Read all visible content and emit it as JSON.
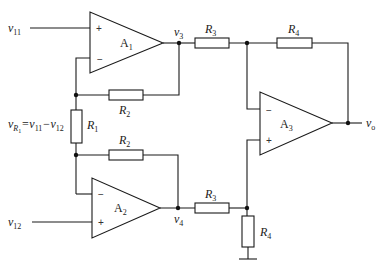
{
  "diagram": {
    "type": "instrumentation-amplifier-circuit",
    "amplifiers": [
      {
        "id": "A1",
        "label": "A",
        "sub": "1",
        "plus": "+",
        "minus": "−"
      },
      {
        "id": "A2",
        "label": "A",
        "sub": "2",
        "plus": "+",
        "minus": "−"
      },
      {
        "id": "A3",
        "label": "A",
        "sub": "3",
        "plus": "+",
        "minus": "−"
      }
    ],
    "resistors": {
      "R1": {
        "label": "R",
        "sub": "1"
      },
      "R2_top": {
        "label": "R",
        "sub": "2"
      },
      "R2_bottom": {
        "label": "R",
        "sub": "2"
      },
      "R3_top": {
        "label": "R",
        "sub": "3"
      },
      "R3_bottom": {
        "label": "R",
        "sub": "3"
      },
      "R4_top": {
        "label": "R",
        "sub": "4"
      },
      "R4_bottom": {
        "label": "R",
        "sub": "4"
      }
    },
    "nodes": {
      "v11": {
        "label": "v",
        "sub": "11"
      },
      "v12": {
        "label": "v",
        "sub": "12"
      },
      "v3": {
        "label": "v",
        "sub": "3"
      },
      "v4": {
        "label": "v",
        "sub": "4"
      },
      "vo": {
        "label": "v",
        "sub": "o"
      }
    },
    "equation": {
      "lhs": "v",
      "lhs_sub": "R",
      "lhs_subsub": "1",
      "rhs": "=v",
      "rhs_sub1": "11",
      "minus": "−v",
      "rhs_sub2": "12"
    }
  }
}
